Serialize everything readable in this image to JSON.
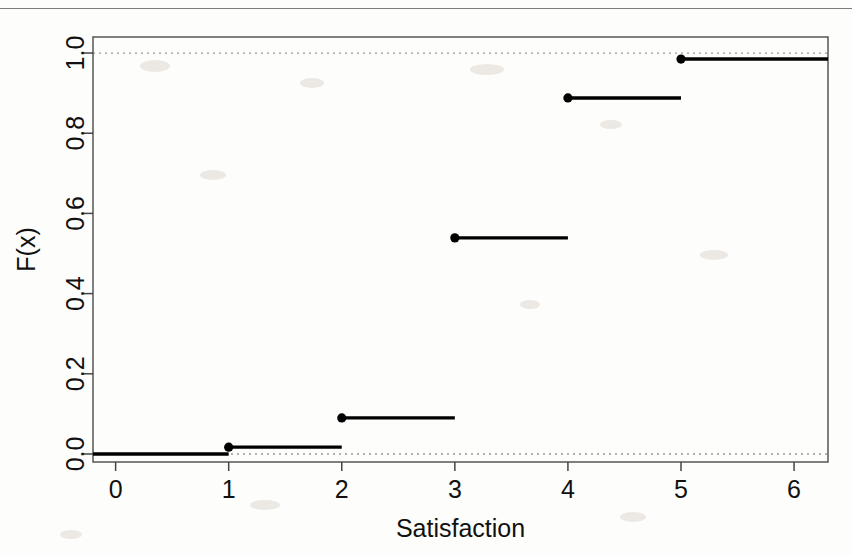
{
  "figure": {
    "title": "",
    "top_rule_visible": true
  },
  "chart_data": {
    "type": "line",
    "subtype": "step-ecdf",
    "title": "",
    "xlabel": "Satisfaction",
    "ylabel": "F(x)",
    "xlim": [
      -0.2,
      6.3
    ],
    "ylim": [
      -0.02,
      1.04
    ],
    "xticks": [
      0,
      1,
      2,
      3,
      4,
      5,
      6
    ],
    "xtick_labels": [
      "0",
      "1",
      "2",
      "3",
      "4",
      "5",
      "6"
    ],
    "yticks": [
      0.0,
      0.2,
      0.4,
      0.6,
      0.8,
      1.0
    ],
    "ytick_labels": [
      "0.0",
      "0.2",
      "0.4",
      "0.6",
      "0.8",
      "1.0"
    ],
    "grid": false,
    "reference_lines": [
      {
        "name": "zero-line",
        "y": 0.0,
        "style": "dotted",
        "color": "#9a9a9a"
      },
      {
        "name": "one-line",
        "y": 1.0,
        "style": "dotted",
        "color": "#9a9a9a"
      }
    ],
    "legend": null,
    "x": [
      1,
      2,
      3,
      4,
      5
    ],
    "values": [
      0.017,
      0.09,
      0.539,
      0.888,
      0.985
    ],
    "steps": [
      {
        "name": "baseline",
        "x_start": -0.2,
        "x_end": 1,
        "y": 0.0,
        "point": false
      },
      {
        "name": "step-1",
        "x_start": 1,
        "x_end": 2,
        "y": 0.017,
        "point": true
      },
      {
        "name": "step-2",
        "x_start": 2,
        "x_end": 3,
        "y": 0.09,
        "point": true
      },
      {
        "name": "step-3",
        "x_start": 3,
        "x_end": 4,
        "y": 0.539,
        "point": true
      },
      {
        "name": "step-4",
        "x_start": 4,
        "x_end": 5,
        "y": 0.888,
        "point": true
      },
      {
        "name": "step-5",
        "x_start": 5,
        "x_end": 6.3,
        "y": 0.985,
        "point": true
      }
    ],
    "line_color": "#000000",
    "point_color": "#000000"
  }
}
